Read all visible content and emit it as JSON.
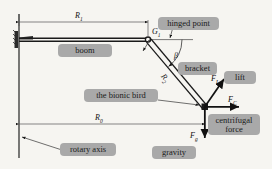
{
  "diagram": {
    "background_color": "#f6f5f1",
    "label_box_color": "#a9a9a9",
    "line_color": "#1a1a1a"
  },
  "labels": {
    "boom": "boom",
    "hinged_point": "hinged point",
    "bracket": "bracket",
    "lift": "lift",
    "bionic_bird": "the bionic bird",
    "centrifugal_force": "centrifugal force",
    "gravity": "gravity",
    "rotary_axis": "rotary axis"
  },
  "symbols": {
    "r1": "R",
    "r1_sub": "1",
    "r0": "R",
    "r0_sub": "0",
    "r2": "R",
    "r2_sub": "2",
    "g1": "G",
    "g1_sub": "1",
    "beta": "β",
    "f_lift": "F",
    "f_lift_sub": "L",
    "f_centrifugal": "F",
    "f_centrifugal_sub": "C",
    "f_gravity": "F",
    "f_gravity_sub": "g"
  }
}
